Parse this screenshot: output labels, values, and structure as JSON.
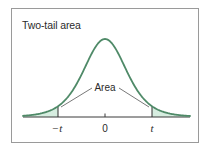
{
  "figure": {
    "title": "Two-tail area",
    "annotation": "Area",
    "tick_labels": {
      "neg_t": "−t",
      "zero": "0",
      "pos_t": "t"
    }
  },
  "colors": {
    "curve": "#4f8a68",
    "tail_fill": "#d6ede0",
    "frame": "#9a9a9a",
    "axis": "#3a3a3a",
    "leader_line": "#555555",
    "text": "#2b2b2b"
  },
  "chart_data": {
    "type": "area",
    "title": "Two-tail area",
    "subtitle": "",
    "xlabel": "",
    "ylabel": "",
    "distribution": "t (bell-shaped, symmetric about 0)",
    "x_ticks": [
      "−t",
      "0",
      "t"
    ],
    "x_tick_positions_std": [
      -2.14,
      0,
      2.14
    ],
    "xlim_std": [
      -3.75,
      3.85
    ],
    "shaded_regions": [
      {
        "from": "-inf",
        "to": "−t",
        "label": "Area"
      },
      {
        "from": "t",
        "to": "inf",
        "label": "Area"
      }
    ],
    "annotations": [
      {
        "text": "Area",
        "points_to": [
          "left tail",
          "right tail"
        ]
      }
    ],
    "grid": false,
    "legend": null,
    "curve_samples": {
      "x_std": [
        -3.75,
        -3.0,
        -2.5,
        -2.14,
        -1.5,
        -1.0,
        -0.5,
        0,
        0.5,
        1.0,
        1.5,
        2.14,
        2.5,
        3.0,
        3.85
      ],
      "density_relative": [
        0.03,
        0.06,
        0.09,
        0.18,
        0.36,
        0.61,
        0.88,
        1.0,
        0.88,
        0.61,
        0.36,
        0.18,
        0.09,
        0.06,
        0.03
      ]
    }
  }
}
